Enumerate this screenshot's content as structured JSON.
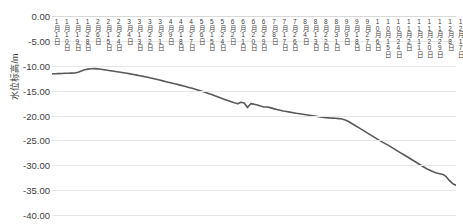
{
  "chart_data": {
    "type": "line",
    "title": "",
    "xlabel": "",
    "ylabel": "水位标高/m",
    "ylim": [
      -40.0,
      0.0
    ],
    "ytick_labels": [
      "0.00",
      "-5.00",
      "-10.00",
      "-15.00",
      "-20.00",
      "-25.00",
      "-30.00",
      "-35.00",
      "-40.00"
    ],
    "ytick_values": [
      0.0,
      -5.0,
      -10.0,
      -15.0,
      -20.0,
      -25.0,
      -30.0,
      -35.0,
      -40.0
    ],
    "grid": true,
    "legend": "none",
    "series_color": "#595959",
    "categories": [
      "1月1日",
      "1月10日",
      "1月19日",
      "1月28日",
      "2月6日",
      "2月15日",
      "2月24日",
      "3月4日",
      "3月13日",
      "3月22日",
      "3月31日",
      "4月9日",
      "4月18日",
      "4月27日",
      "5月6日",
      "5月15日",
      "5月24日",
      "6月2日",
      "6月11日",
      "6月20日",
      "6月29日",
      "7月8日",
      "7月17日",
      "7月26日",
      "8月4日",
      "8月13日",
      "8月22日",
      "8月31日",
      "9月9日",
      "9月18日",
      "9月27日",
      "10月6日",
      "10月15日",
      "10月24日",
      "11月2日",
      "11月11日",
      "11月20日",
      "11月29日",
      "12月8日",
      "12月17日"
    ],
    "series": [
      {
        "name": "水位标高",
        "values": [
          -11.6,
          -11.55,
          -11.45,
          -10.75,
          -10.6,
          -10.85,
          -11.1,
          -11.4,
          -11.75,
          -12.1,
          -12.45,
          -12.85,
          -13.2,
          -13.6,
          -14.05,
          -14.5,
          -15.0,
          -15.6,
          -16.2,
          -16.8,
          -18.4,
          -17.6,
          -18.3,
          -18.8,
          -19.3,
          -19.65,
          -19.95,
          -20.25,
          -20.45,
          -20.6,
          -21.2,
          -22.3,
          -23.4,
          -24.6,
          -25.9,
          -27.3,
          -28.8,
          -30.6,
          -31.6,
          -34.0
        ]
      }
    ],
    "dense_points": [
      -11.6,
      -11.62,
      -11.58,
      -11.55,
      -11.52,
      -11.5,
      -11.48,
      -11.45,
      -11.3,
      -11.05,
      -10.8,
      -10.68,
      -10.6,
      -10.58,
      -10.62,
      -10.7,
      -10.8,
      -10.92,
      -11.02,
      -11.12,
      -11.22,
      -11.32,
      -11.42,
      -11.52,
      -11.64,
      -11.76,
      -11.88,
      -12.0,
      -12.14,
      -12.28,
      -12.42,
      -12.56,
      -12.72,
      -12.88,
      -13.04,
      -13.2,
      -13.36,
      -13.52,
      -13.68,
      -13.84,
      -14.0,
      -14.18,
      -14.36,
      -14.54,
      -14.72,
      -14.92,
      -15.12,
      -15.34,
      -15.56,
      -15.8,
      -16.04,
      -16.28,
      -16.52,
      -16.76,
      -17.0,
      -17.22,
      -17.44,
      -17.64,
      -17.32,
      -17.48,
      -18.4,
      -17.62,
      -17.72,
      -17.88,
      -18.1,
      -18.3,
      -18.28,
      -18.42,
      -18.62,
      -18.8,
      -18.94,
      -19.08,
      -19.2,
      -19.32,
      -19.44,
      -19.56,
      -19.66,
      -19.76,
      -19.86,
      -19.96,
      -20.06,
      -20.16,
      -20.26,
      -20.34,
      -20.42,
      -20.48,
      -20.52,
      -20.56,
      -20.62,
      -20.72,
      -20.9,
      -21.2,
      -21.6,
      -22.0,
      -22.4,
      -22.8,
      -23.2,
      -23.6,
      -24.0,
      -24.4,
      -24.8,
      -25.2,
      -25.55,
      -25.9,
      -26.3,
      -26.7,
      -27.1,
      -27.5,
      -27.9,
      -28.3,
      -28.7,
      -29.1,
      -29.5,
      -29.9,
      -30.3,
      -30.7,
      -31.0,
      -31.3,
      -31.55,
      -31.7,
      -31.85,
      -32.3,
      -33.1,
      -33.7,
      -34.0
    ]
  }
}
